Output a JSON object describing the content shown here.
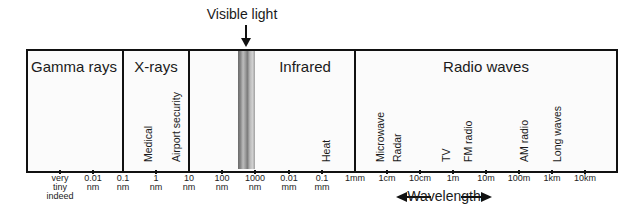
{
  "visible_light": {
    "label": "Visible light"
  },
  "regions": [
    {
      "label": "Gamma rays",
      "x": 74
    },
    {
      "label": "X-rays",
      "x": 156
    },
    {
      "label": "Infrared",
      "x": 305
    },
    {
      "label": "Radio waves",
      "x": 486
    }
  ],
  "uses": [
    {
      "label": "Medical",
      "x": 150
    },
    {
      "label": "Airport security",
      "x": 178
    },
    {
      "label": "Heat",
      "x": 328
    },
    {
      "label": "Microwave",
      "x": 382
    },
    {
      "label": "Radar",
      "x": 399
    },
    {
      "label": "TV",
      "x": 448
    },
    {
      "label": "FM radio",
      "x": 470
    },
    {
      "label": "AM radio",
      "x": 526
    },
    {
      "label": "Long waves",
      "x": 559
    }
  ],
  "ticks": [
    {
      "x": 60,
      "line1": "very",
      "line2": "tiny",
      "line3": "indeed"
    },
    {
      "x": 93,
      "line1": "0.01",
      "line2": "nm"
    },
    {
      "x": 123,
      "line1": "0.1",
      "line2": "nm"
    },
    {
      "x": 156,
      "line1": "1",
      "line2": "nm"
    },
    {
      "x": 189,
      "line1": "10",
      "line2": "nm"
    },
    {
      "x": 222,
      "line1": "100",
      "line2": "nm"
    },
    {
      "x": 255,
      "line1": "1000",
      "line2": "nm"
    },
    {
      "x": 289,
      "line1": "0.01",
      "line2": "mm"
    },
    {
      "x": 322,
      "line1": "0.1",
      "line2": "mm"
    },
    {
      "x": 355,
      "line1": "1mm"
    },
    {
      "x": 387,
      "line1": "1cm"
    },
    {
      "x": 420,
      "line1": "10cm"
    },
    {
      "x": 453,
      "line1": "1m"
    },
    {
      "x": 486,
      "line1": "10m"
    },
    {
      "x": 519,
      "line1": "100m"
    },
    {
      "x": 552,
      "line1": "1km"
    },
    {
      "x": 585,
      "line1": "10km"
    }
  ],
  "axis": {
    "label": "Wavelength"
  },
  "colors": {
    "line": "#111111",
    "background": "#fbfbfb"
  }
}
